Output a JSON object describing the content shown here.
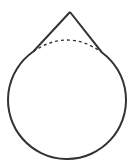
{
  "diagram": {
    "type": "geometric-figure",
    "colors": {
      "stroke": "#333333",
      "background": "#ffffff"
    },
    "apex": {
      "x": 70,
      "y": 12
    },
    "circle": {
      "cx": 67,
      "cy": 100,
      "r": 59
    },
    "left_join": {
      "x": 33,
      "y": 51
    },
    "right_join": {
      "x": 103,
      "y": 51
    },
    "dashed_arc_peak_y": 40
  }
}
